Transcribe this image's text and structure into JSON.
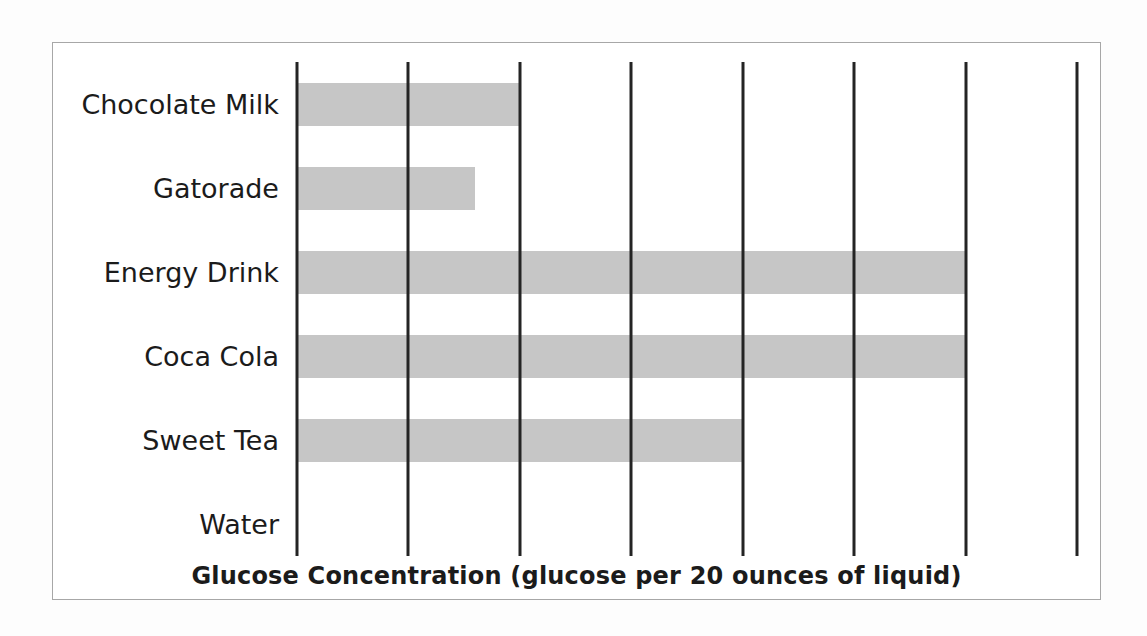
{
  "chart": {
    "colors": {
      "bar_fill": "#c6c6c6",
      "gridline": "#242424",
      "box_border": "#a7a7a7",
      "text": "#1b1b1b",
      "background": "#ffffff"
    }
  },
  "chart_data": {
    "type": "bar",
    "orientation": "horizontal",
    "title": "Glucose Concentration (glucose per 20 ounces of liquid)",
    "xlabel": "",
    "ylabel": "",
    "categories": [
      "Chocolate Milk",
      "Gatorade",
      "Energy Drink",
      "Coca Cola",
      "Sweet Tea",
      "Water"
    ],
    "values": [
      2,
      1.6,
      6,
      6,
      4,
      0
    ],
    "xlim": [
      0,
      7
    ],
    "gridline_values": [
      0,
      1,
      2,
      3,
      4,
      5,
      6,
      7
    ],
    "grid": "vertical lines only",
    "axis_tick_labels_shown": false,
    "value_labels_shown": false,
    "legend": "none"
  }
}
